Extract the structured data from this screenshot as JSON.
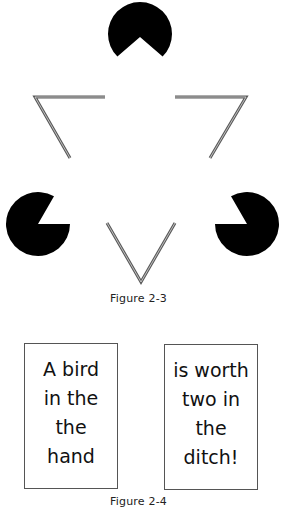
{
  "figure_2_3": {
    "caption": "Figure 2-3",
    "description": "Kanizsa illusory triangle: three black pac-man discs and three outlined chevrons",
    "colors": {
      "disc_fill": "#000000",
      "line_stroke": "#5a5a5a",
      "line_inner": "#d8d8d8",
      "background": "#ffffff"
    },
    "discs": [
      {
        "name": "top",
        "cx": 140,
        "cy": 34,
        "r": 32,
        "opening": "down"
      },
      {
        "name": "left",
        "cx": 38,
        "cy": 224,
        "r": 32,
        "opening": "upper-right"
      },
      {
        "name": "right",
        "cx": 247,
        "cy": 224,
        "r": 32,
        "opening": "upper-left"
      }
    ],
    "chevrons": [
      {
        "name": "top-left",
        "points": "105,97 35,97 70,158"
      },
      {
        "name": "top-right",
        "points": "175,97 246,97 210,158"
      },
      {
        "name": "bottom",
        "points": "107,223 141,282 175,223"
      }
    ]
  },
  "figure_2_4": {
    "caption": "Figure 2-4",
    "cards": [
      {
        "lines": [
          "A bird",
          "in the",
          "the",
          "hand"
        ]
      },
      {
        "lines": [
          "is worth",
          "two in",
          "the",
          "ditch!"
        ]
      }
    ]
  }
}
